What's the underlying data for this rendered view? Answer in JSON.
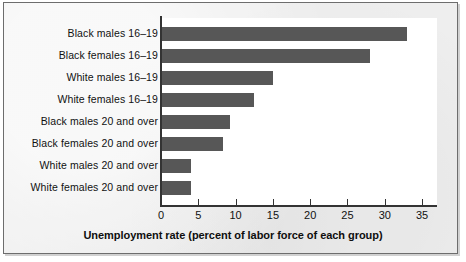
{
  "chart_data": {
    "type": "bar",
    "orientation": "horizontal",
    "title": "",
    "xlabel": "Unemployment rate (percent of labor force of each group)",
    "ylabel": "",
    "xlim": [
      0,
      37
    ],
    "xticks": [
      0,
      5,
      10,
      15,
      20,
      25,
      30,
      35
    ],
    "grid": false,
    "legend": false,
    "bar_color": "#575757",
    "plot_background": "#ffffff",
    "panel_background": "#eeeeee",
    "categories": [
      "Black males 16–19",
      "Black females 16–19",
      "White males 16–19",
      "White females 16–19",
      "Black males 20 and over",
      "Black females 20 and over",
      "White males 20 and over",
      "White females 20 and over"
    ],
    "values": [
      33,
      28,
      15,
      12.5,
      9.2,
      8.3,
      4,
      4
    ]
  }
}
